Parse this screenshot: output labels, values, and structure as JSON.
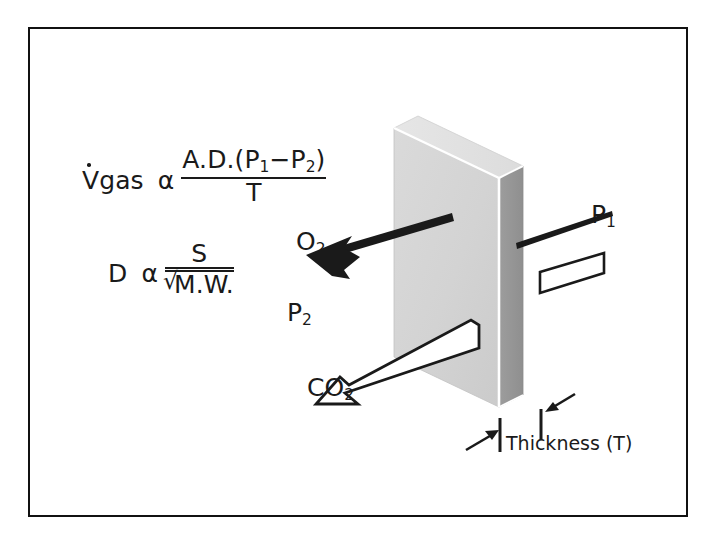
{
  "figure": {
    "border_color": "#111111",
    "background": "#ffffff"
  },
  "equations": {
    "fick": {
      "lhs_dot_var": "V",
      "lhs_sub": "gas",
      "proportional": "α",
      "numerator": "A.D.(P",
      "numerator_sub1": "1",
      "numerator_mid": "−P",
      "numerator_sub2": "2",
      "numerator_end": ")",
      "denominator": "T",
      "plain": "Vgas α A.D.(P1−P2)/T"
    },
    "graham": {
      "lhs": "D",
      "proportional": "α",
      "numerator": "S",
      "denominator": "M.W.",
      "radical": "√",
      "plain": "D α S/√M.W."
    }
  },
  "labels": {
    "oxygen": "O",
    "oxygen_sub": "2",
    "carbon_dioxide": "CO",
    "carbon_dioxide_sub": "2",
    "pressure_high": "P",
    "pressure_high_sub": "1",
    "pressure_low": "P",
    "pressure_low_sub": "2",
    "thickness": "Thickness (T)"
  },
  "membrane": {
    "front_face_color": "#d4d4d4",
    "top_face_color": "#e2e2e2",
    "side_face_color": "#969696",
    "edge_color": "#ffffff",
    "outline_color": "#8c8c8c"
  },
  "arrows": {
    "oxygen_arrow": {
      "style": "solid",
      "fill": "#1a1a1a",
      "direction": "left-down",
      "meaning": "O2 diffuses from P1 side to P2 side"
    },
    "carbon_dioxide_arrow": {
      "style": "outlined",
      "fill": "#ffffff",
      "stroke": "#1a1a1a",
      "direction": "left-down",
      "meaning": "CO2 diffuses from P1 side to P2 side"
    },
    "thickness_markers": {
      "style": "tick-and-arrow",
      "color": "#1a1a1a",
      "count": 2
    }
  }
}
